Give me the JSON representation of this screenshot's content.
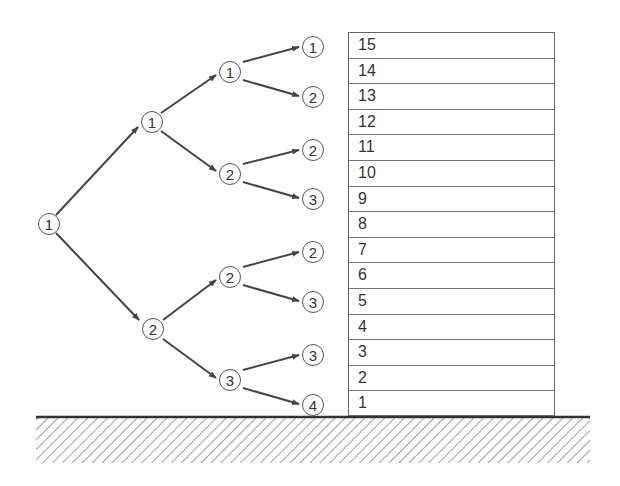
{
  "diagram": {
    "type": "tree-with-floor-stack",
    "tree": {
      "root": {
        "id": "n0",
        "label": "1"
      },
      "levels": [
        [
          {
            "id": "n0",
            "label": "1"
          }
        ],
        [
          {
            "id": "n1",
            "label": "1"
          },
          {
            "id": "n2",
            "label": "2"
          }
        ],
        [
          {
            "id": "n3",
            "label": "1"
          },
          {
            "id": "n4",
            "label": "2"
          },
          {
            "id": "n5",
            "label": "2"
          },
          {
            "id": "n6",
            "label": "3"
          }
        ],
        [
          {
            "id": "n7",
            "label": "1"
          },
          {
            "id": "n8",
            "label": "2"
          },
          {
            "id": "n9",
            "label": "2"
          },
          {
            "id": "n10",
            "label": "3"
          },
          {
            "id": "n11",
            "label": "2"
          },
          {
            "id": "n12",
            "label": "3"
          },
          {
            "id": "n13",
            "label": "3"
          },
          {
            "id": "n14",
            "label": "4"
          }
        ]
      ],
      "edges": [
        [
          "n0",
          "n1"
        ],
        [
          "n0",
          "n2"
        ],
        [
          "n1",
          "n3"
        ],
        [
          "n1",
          "n4"
        ],
        [
          "n2",
          "n5"
        ],
        [
          "n2",
          "n6"
        ],
        [
          "n3",
          "n7"
        ],
        [
          "n3",
          "n8"
        ],
        [
          "n4",
          "n9"
        ],
        [
          "n4",
          "n10"
        ],
        [
          "n5",
          "n11"
        ],
        [
          "n5",
          "n12"
        ],
        [
          "n6",
          "n13"
        ],
        [
          "n6",
          "n14"
        ]
      ]
    },
    "floors": {
      "labels_top_to_bottom": [
        "15",
        "14",
        "13",
        "12",
        "11",
        "10",
        "9",
        "8",
        "7",
        "6",
        "5",
        "4",
        "3",
        "2",
        "1"
      ]
    },
    "ground": {
      "hatched": true
    }
  },
  "nodes": {
    "n0": "1",
    "n1": "1",
    "n2": "2",
    "n3": "1",
    "n4": "2",
    "n5": "2",
    "n6": "3",
    "n7": "1",
    "n8": "2",
    "n9": "2",
    "n10": "3",
    "n11": "2",
    "n12": "3",
    "n13": "3",
    "n14": "4"
  },
  "floor_rows": [
    "15",
    "14",
    "13",
    "12",
    "11",
    "10",
    "9",
    "8",
    "7",
    "6",
    "5",
    "4",
    "3",
    "2",
    "1"
  ]
}
